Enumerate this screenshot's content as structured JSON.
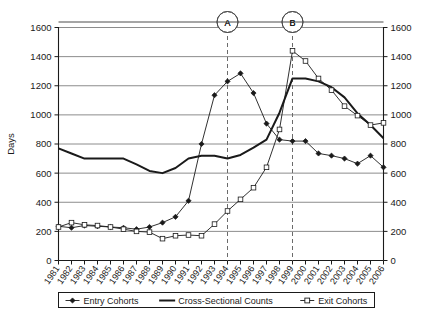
{
  "chart_data": {
    "type": "line",
    "title": "",
    "xlabel": "",
    "ylabel": "Days",
    "ylim": [
      0,
      1600
    ],
    "yticks": [
      0,
      200,
      400,
      600,
      800,
      1000,
      1200,
      1400,
      1600
    ],
    "grid": true,
    "dual_y_axis": true,
    "legend_position": "bottom",
    "x": [
      1981,
      1982,
      1983,
      1984,
      1985,
      1986,
      1987,
      1988,
      1989,
      1990,
      1991,
      1992,
      1993,
      1994,
      1995,
      1996,
      1997,
      1998,
      1999,
      2000,
      2001,
      2002,
      2003,
      2004,
      2005,
      2006
    ],
    "categories": [
      "1981",
      "1982",
      "1983",
      "1984",
      "1985",
      "1986",
      "1987",
      "1988",
      "1989",
      "1990",
      "1991",
      "1992",
      "1993",
      "1994",
      "1995",
      "1996",
      "1997",
      "1998",
      "1999",
      "2000",
      "2001",
      "2002",
      "2003",
      "2004",
      "2005",
      "2006"
    ],
    "series": [
      {
        "name": "Entry Cohorts",
        "marker": "filled-diamond",
        "values": [
          235,
          225,
          240,
          235,
          230,
          225,
          215,
          230,
          260,
          300,
          410,
          800,
          1135,
          1230,
          1285,
          1150,
          940,
          830,
          820,
          820,
          735,
          720,
          700,
          665,
          720,
          640
        ]
      },
      {
        "name": "Cross-Sectional Counts",
        "marker": "none",
        "values": [
          770,
          735,
          700,
          700,
          700,
          700,
          660,
          615,
          600,
          635,
          700,
          720,
          720,
          700,
          725,
          775,
          830,
          1015,
          1250,
          1250,
          1230,
          1190,
          1120,
          1010,
          930,
          840
        ]
      },
      {
        "name": "Exit Cohorts",
        "marker": "open-square",
        "values": [
          230,
          260,
          245,
          240,
          230,
          215,
          200,
          195,
          150,
          170,
          175,
          170,
          250,
          340,
          420,
          500,
          640,
          900,
          1440,
          1370,
          1250,
          1170,
          1060,
          995,
          930,
          945
        ]
      }
    ],
    "annotations": [
      {
        "label": "A",
        "x": 1994,
        "type": "vertical-dashed-line-with-circle"
      },
      {
        "label": "B",
        "x": 1999,
        "type": "vertical-dashed-line-with-circle"
      }
    ]
  },
  "axes": {
    "y_title": "Days",
    "y_tick_labels": [
      "1600",
      "1400",
      "1200",
      "1000",
      "800",
      "600",
      "400",
      "200",
      "0"
    ],
    "y_right_tick_labels": [
      "1600",
      "1400",
      "1200",
      "1000",
      "800",
      "600",
      "400",
      "200",
      "0"
    ],
    "x_tick_labels": [
      "1981",
      "1982",
      "1983",
      "1984",
      "1985",
      "1986",
      "1987",
      "1988",
      "1989",
      "1990",
      "1991",
      "1992",
      "1993",
      "1994",
      "1995",
      "1996",
      "1997",
      "1998",
      "1999",
      "2000",
      "2001",
      "2002",
      "2003",
      "2004",
      "2005",
      "2006"
    ]
  },
  "legend": {
    "items": [
      {
        "label": "Entry Cohorts",
        "marker": "filled-diamond"
      },
      {
        "label": "Cross-Sectional Counts",
        "marker": "line"
      },
      {
        "label": "Exit Cohorts",
        "marker": "open-square"
      }
    ]
  },
  "markers": {
    "a_label": "A",
    "b_label": "B"
  },
  "colors": {
    "line": "#1a1a1a",
    "grid": "#8c8c8c",
    "axis": "#1a1a1a",
    "background": "#ffffff"
  }
}
